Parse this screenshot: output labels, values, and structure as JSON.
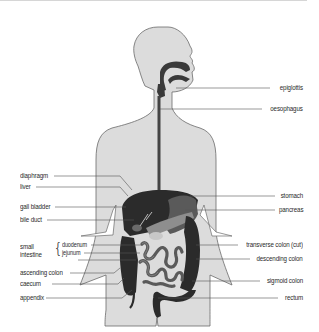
{
  "diagram": {
    "colors": {
      "body_fill": "#dcdcdc",
      "body_outline": "#6a6a6a",
      "organ_dark": "#2b2b2b",
      "organ_mid": "#5a5a5a",
      "organ_light": "#9a9a9a",
      "leader_line": "#555555",
      "label_text": "#2a2a2a"
    },
    "labels_right": [
      {
        "id": "epiglottis",
        "text": "epiglottis"
      },
      {
        "id": "oesophagus",
        "text": "oesophagus"
      },
      {
        "id": "stomach",
        "text": "stomach"
      },
      {
        "id": "pancreas",
        "text": "pancreas"
      },
      {
        "id": "transverse-colon",
        "text": "transverse colon (cut)"
      },
      {
        "id": "descending-colon",
        "text": "descending colon"
      },
      {
        "id": "sigmoid-colon",
        "text": "sigmoid colon"
      },
      {
        "id": "rectum",
        "text": "rectum"
      }
    ],
    "labels_left": [
      {
        "id": "diaphragm",
        "text": "diaphragm"
      },
      {
        "id": "liver",
        "text": "liver"
      },
      {
        "id": "gall-bladder",
        "text": "gall bladder"
      },
      {
        "id": "bile-duct",
        "text": "bile duct"
      },
      {
        "id": "ascending-colon",
        "text": "ascending colon"
      },
      {
        "id": "caecum",
        "text": "caecum"
      },
      {
        "id": "appendix",
        "text": "appendix"
      }
    ],
    "small_intestine": {
      "group_label_line1": "small",
      "group_label_line2": "intestine",
      "parts": [
        {
          "id": "duodenum",
          "text": "duodenum"
        },
        {
          "id": "jejunum",
          "text": "jejunum"
        }
      ]
    }
  }
}
